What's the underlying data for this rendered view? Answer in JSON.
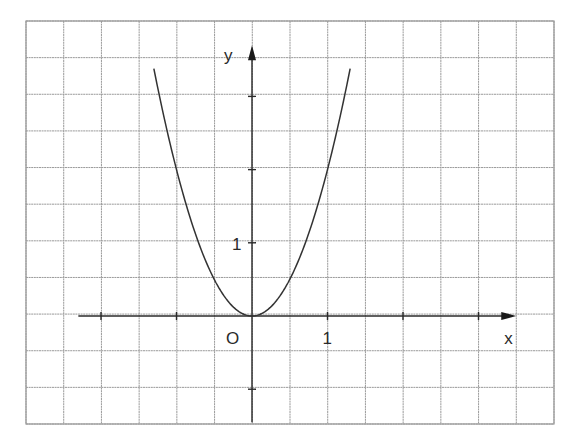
{
  "chart_data": {
    "type": "line",
    "title": "",
    "function": "y = 2x^2",
    "xlabel": "x",
    "ylabel": "y",
    "origin_label": "O",
    "grid": true,
    "grid_step": 0.5,
    "xlim": [
      -3.3,
      4.0
    ],
    "ylim": [
      -1.5,
      3.9
    ],
    "axis_x_range": [
      -2.3,
      3.5
    ],
    "axis_y_range": [
      -1.45,
      3.7
    ],
    "x_tick_labels": [
      {
        "value": 1,
        "label": "1"
      }
    ],
    "y_tick_labels": [
      {
        "value": 1,
        "label": "1"
      }
    ],
    "x_ticks": [
      -2,
      -1,
      1,
      2,
      3
    ],
    "y_ticks": [
      -1,
      1,
      2,
      3
    ],
    "series": [
      {
        "name": "y = 2x^2",
        "x": [
          -1.3,
          -1.25,
          -1.0,
          -0.75,
          -0.5,
          -0.25,
          0,
          0.25,
          0.5,
          0.75,
          1.0,
          1.25,
          1.3
        ],
        "y": [
          3.38,
          3.125,
          2.0,
          1.125,
          0.5,
          0.125,
          0,
          0.125,
          0.5,
          1.125,
          2.0,
          3.125,
          3.38
        ]
      }
    ],
    "legend": "none"
  }
}
